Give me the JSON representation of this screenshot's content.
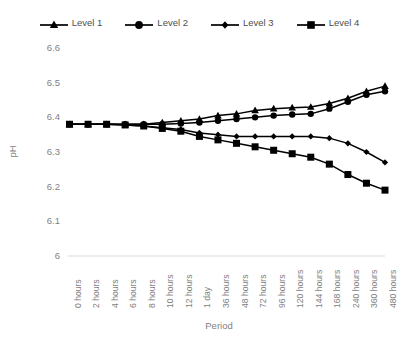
{
  "chart_data": {
    "type": "line",
    "title": "",
    "xlabel": "Period",
    "ylabel": "pH",
    "ylim": [
      6,
      6.6
    ],
    "ytick_values": [
      6.6,
      6.5,
      6.4,
      6.3,
      6.2,
      6.1,
      6
    ],
    "ytick_labels": [
      "6.6",
      "6.5",
      "6.4",
      "6.3",
      "6.2",
      "6.1",
      "6"
    ],
    "grid": false,
    "legend_position": "top",
    "categories": [
      "0 hours",
      "2 hours",
      "4 hours",
      "6 hours",
      "8 hours",
      "10 hours",
      "12 hours",
      "1 day",
      "36 hours",
      "48 hours",
      "72 hours",
      "96 hours",
      "120 hours",
      "144 hours",
      "168 hours",
      "240 hours",
      "360 hours",
      "480 hours"
    ],
    "series": [
      {
        "name": "Level 1",
        "marker": "triangle",
        "color": "#000000",
        "values": [
          6.38,
          6.38,
          6.38,
          6.38,
          6.38,
          6.385,
          6.39,
          6.395,
          6.405,
          6.41,
          6.42,
          6.425,
          6.428,
          6.43,
          6.44,
          6.455,
          6.475,
          6.49
        ]
      },
      {
        "name": "Level 2",
        "marker": "circle",
        "color": "#000000",
        "values": [
          6.38,
          6.38,
          6.38,
          6.38,
          6.38,
          6.38,
          6.382,
          6.385,
          6.39,
          6.395,
          6.4,
          6.405,
          6.408,
          6.41,
          6.425,
          6.445,
          6.465,
          6.475
        ]
      },
      {
        "name": "Level 3",
        "marker": "diamond",
        "color": "#000000",
        "values": [
          6.38,
          6.38,
          6.38,
          6.378,
          6.375,
          6.37,
          6.365,
          6.355,
          6.35,
          6.345,
          6.345,
          6.345,
          6.345,
          6.345,
          6.34,
          6.325,
          6.3,
          6.27
        ]
      },
      {
        "name": "Level 4",
        "marker": "square",
        "color": "#000000",
        "values": [
          6.38,
          6.38,
          6.38,
          6.378,
          6.375,
          6.368,
          6.36,
          6.345,
          6.335,
          6.325,
          6.315,
          6.305,
          6.295,
          6.285,
          6.265,
          6.235,
          6.21,
          6.19
        ]
      }
    ]
  },
  "legend": {
    "entries": [
      {
        "label": "Level 1",
        "marker": "triangle"
      },
      {
        "label": "Level 2",
        "marker": "circle"
      },
      {
        "label": "Level 3",
        "marker": "diamond"
      },
      {
        "label": "Level 4",
        "marker": "square"
      }
    ]
  }
}
